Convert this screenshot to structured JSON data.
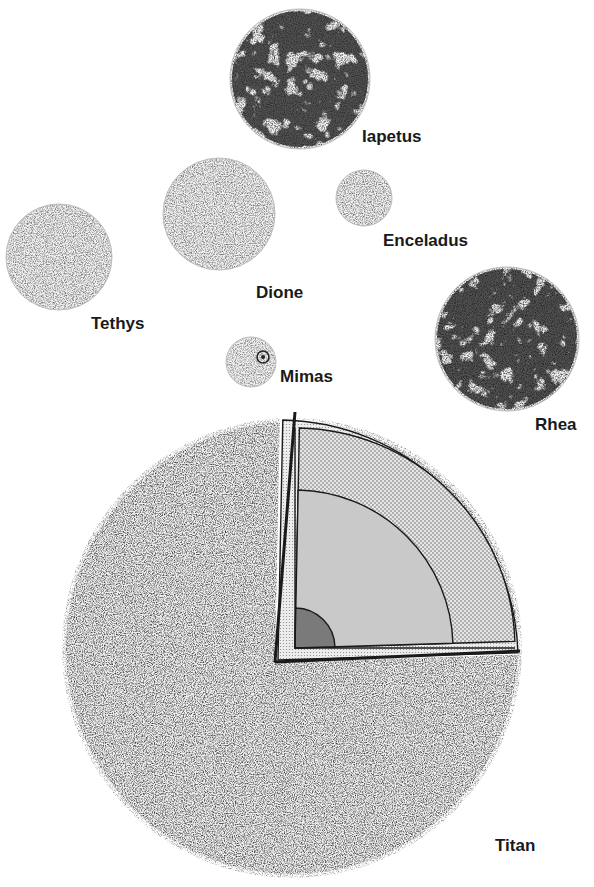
{
  "moons": [
    {
      "id": "iapetus",
      "name": "Iapetus"
    },
    {
      "id": "enceladus",
      "name": "Enceladus"
    },
    {
      "id": "dione",
      "name": "Dione"
    },
    {
      "id": "tethys",
      "name": "Tethys"
    },
    {
      "id": "mimas",
      "name": "Mimas"
    },
    {
      "id": "rhea",
      "name": "Rhea"
    },
    {
      "id": "titan",
      "name": "Titan"
    }
  ],
  "titan_cutaway": {
    "layers": [
      "outer crust",
      "mantle (stippled)",
      "inner mantle",
      "core"
    ]
  },
  "colors": {
    "ink": "#1a1a1a",
    "mantle": "#d4d4d4",
    "inner": "#c9c9c9",
    "core": "#7a7a7a"
  }
}
